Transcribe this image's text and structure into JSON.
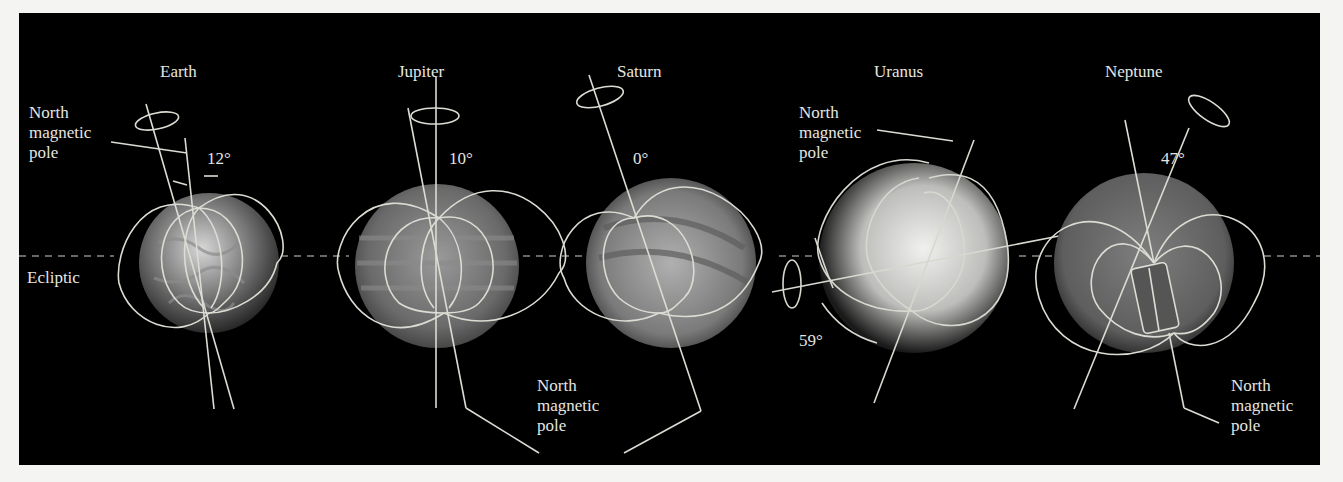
{
  "figure": {
    "background": "#000000",
    "line_color": "#d8d8d0",
    "ecliptic_label": "Ecliptic"
  },
  "planets": [
    {
      "name": "Earth",
      "tilt_label": "12°",
      "pole_label": "North\nmagnetic\npole"
    },
    {
      "name": "Jupiter",
      "tilt_label": "10°",
      "pole_label": "North\nmagnetic\npole"
    },
    {
      "name": "Saturn",
      "tilt_label": "0°",
      "pole_label": "North\nmagnetic\npole"
    },
    {
      "name": "Uranus",
      "tilt_label": "59°",
      "pole_label": "North\nmagnetic\npole"
    },
    {
      "name": "Neptune",
      "tilt_label": "47°",
      "pole_label": "North\nmagnetic\npole"
    }
  ]
}
